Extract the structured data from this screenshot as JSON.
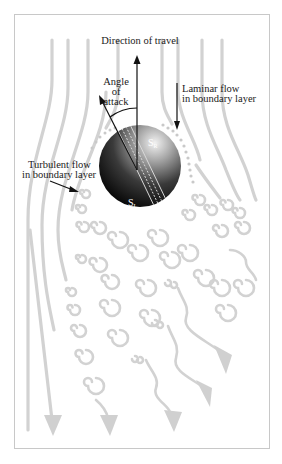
{
  "figure": {
    "labels": {
      "direction": "Direction of travel",
      "angle_line1": "Angle",
      "angle_line2": "of",
      "angle_line3": "attack",
      "laminar_line1": "Laminar flow",
      "laminar_line2": "in boundary layer",
      "turbulent_line1": "Turbulent flow",
      "turbulent_line2": "in boundary layer",
      "s_upper": "S",
      "s_upper_sub": "R",
      "s_lower": "S",
      "s_lower_sub": "L"
    },
    "colors": {
      "flow_lines": "#d2d2d2",
      "frame": "#c8c8c8",
      "ball_dark": "#0d0d0d",
      "ball_light": "#e8e8e8",
      "text": "#1a1a1a",
      "arrows": "#111111"
    }
  }
}
